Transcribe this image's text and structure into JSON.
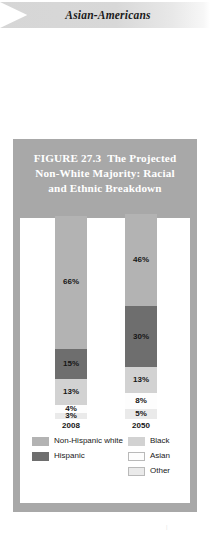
{
  "banner": {
    "title": "Asian-Americans"
  },
  "figure": {
    "number": "FIGURE 27.3",
    "title_line1": "The Projected",
    "title_line2": "Non-White Majority: Racial",
    "title_line3": "and Ethnic Breakdown"
  },
  "chart_data": {
    "type": "bar",
    "subtype": "stacked-column-100",
    "xlabel": "",
    "ylabel": "",
    "ylim": [
      0,
      100
    ],
    "grid": false,
    "legend_position": "bottom",
    "categories": [
      "2008",
      "2050"
    ],
    "series": [
      {
        "name": "Non-Hispanic white",
        "color": "#b3b3b3",
        "values": [
          66,
          46
        ],
        "labels": [
          "66%",
          "46%"
        ]
      },
      {
        "name": "Hispanic",
        "color": "#6e6e6e",
        "values": [
          15,
          30
        ],
        "labels": [
          "15%",
          "30%"
        ]
      },
      {
        "name": "Black",
        "color": "#d2d2d2",
        "values": [
          13,
          13
        ],
        "labels": [
          "13%",
          "13%"
        ]
      },
      {
        "name": "Asian",
        "color": "#fdfdfd",
        "values": [
          4,
          8
        ],
        "labels": [
          "4%",
          "8%"
        ]
      },
      {
        "name": "Other",
        "color": "#eaeaea",
        "values": [
          3,
          5
        ],
        "labels": [
          "3%",
          "5%"
        ]
      }
    ]
  },
  "legend": {
    "left": [
      {
        "label": "Non-Hispanic white",
        "color": "#b3b3b3"
      },
      {
        "label": "Hispanic",
        "color": "#6e6e6e"
      }
    ],
    "right": [
      {
        "label": "Black",
        "color": "#d2d2d2"
      },
      {
        "label": "Asian",
        "color": "#fdfdfd"
      },
      {
        "label": "Other",
        "color": "#eaeaea"
      }
    ]
  },
  "page_mark": "|"
}
